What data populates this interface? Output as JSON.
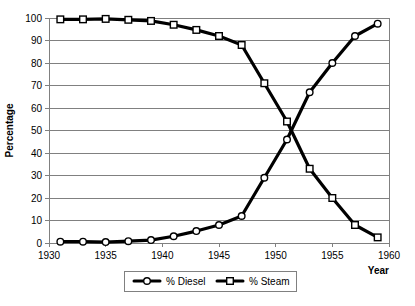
{
  "chart_data": {
    "type": "line",
    "title": "",
    "xlabel": "Year",
    "ylabel": "Percentage",
    "xlim": [
      1930,
      1960
    ],
    "ylim": [
      0,
      100
    ],
    "grid": "horizontal",
    "legend_position": "bottom",
    "x": [
      1931,
      1933,
      1935,
      1937,
      1939,
      1941,
      1943,
      1945,
      1947,
      1949,
      1951,
      1953,
      1955,
      1957,
      1959
    ],
    "xticks": [
      "1930",
      "1935",
      "1940",
      "1945",
      "1950",
      "1955",
      "1960"
    ],
    "xtick_values": [
      1930,
      1935,
      1940,
      1945,
      1950,
      1955,
      1960
    ],
    "yticks": [
      "0",
      "10",
      "20",
      "30",
      "40",
      "50",
      "60",
      "70",
      "80",
      "90",
      "100"
    ],
    "ytick_values": [
      0,
      10,
      20,
      30,
      40,
      50,
      60,
      70,
      80,
      90,
      100
    ],
    "series": [
      {
        "name": "% Diesel",
        "marker": "circle",
        "values": [
          0.6,
          0.6,
          0.4,
          0.8,
          1.3,
          3.0,
          5.3,
          8.0,
          12.0,
          29.0,
          46.0,
          67.0,
          80.0,
          92.0,
          97.5
        ]
      },
      {
        "name": "% Steam",
        "marker": "square",
        "values": [
          99.4,
          99.4,
          99.6,
          99.2,
          98.7,
          97.0,
          94.7,
          92.0,
          88.0,
          71.0,
          54.0,
          33.0,
          20.0,
          8.0,
          2.5
        ]
      }
    ],
    "colors": {
      "line": "#000000",
      "marker_fill": "#ffffff",
      "grid": "#808080",
      "axis": "#808080",
      "background": "#ffffff"
    }
  },
  "legend": {
    "items": [
      {
        "label": "% Diesel",
        "marker": "circle-marker"
      },
      {
        "label": "% Steam",
        "marker": "square-marker"
      }
    ]
  }
}
